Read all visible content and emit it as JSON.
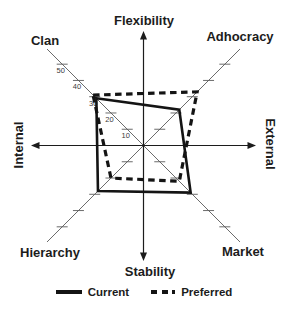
{
  "figure": {
    "background": "#ffffff",
    "axis_color": "#1c1c1c",
    "grid_color": "#5a5a5a"
  },
  "chart_data": {
    "type": "radar",
    "axes_labels": {
      "top": "Flexibility",
      "bottom": "Stability",
      "left": "Internal",
      "right": "External",
      "top_left": "Clan",
      "top_right": "Adhocracy",
      "bottom_left": "Hierarchy",
      "bottom_right": "Market"
    },
    "categories": [
      "Clan",
      "Adhocracy",
      "Market",
      "Hierarchy"
    ],
    "scale": {
      "min": 0,
      "max": 50,
      "tick_step": 10,
      "tick_labels": [
        "50",
        "40",
        "30",
        "20",
        "10"
      ],
      "labeled_axis": "Clan"
    },
    "series": [
      {
        "name": "Current",
        "style": "solid",
        "color": "#141414",
        "values": {
          "Clan": 29,
          "Adhocracy": 22,
          "Market": 29,
          "Hierarchy": 28
        }
      },
      {
        "name": "Preferred",
        "style": "dashed",
        "color": "#141414",
        "values": {
          "Clan": 31,
          "Adhocracy": 33,
          "Market": 22,
          "Hierarchy": 20
        }
      }
    ],
    "legend": [
      {
        "label": "Current",
        "style": "solid"
      },
      {
        "label": "Preferred",
        "style": "dashed"
      }
    ]
  }
}
